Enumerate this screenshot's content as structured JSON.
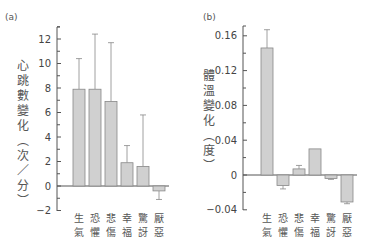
{
  "chart_data": [
    {
      "panel": "(a)",
      "type": "bar",
      "title": "",
      "ylabel": "心跳數變化（次/分）",
      "xlabel": "",
      "categories": [
        "生氣",
        "恐懼",
        "悲傷",
        "幸福",
        "驚訝",
        "厭惡"
      ],
      "values": [
        7.9,
        7.9,
        6.9,
        1.9,
        1.6,
        -0.4
      ],
      "error_ends": [
        10.4,
        12.4,
        11.7,
        3.3,
        5.8,
        -1.1
      ],
      "ylim": [
        -2,
        13
      ],
      "yticks": [
        -2,
        0,
        2,
        4,
        6,
        8,
        10,
        12
      ],
      "ytick_labels": [
        "−2",
        "0",
        "2",
        "4",
        "6",
        "8",
        "10",
        "12"
      ],
      "grid": false,
      "bar_color": "#d0d0d0"
    },
    {
      "panel": "(b)",
      "type": "bar",
      "title": "",
      "ylabel": "體溫變化（度）",
      "xlabel": "",
      "categories": [
        "生氣",
        "恐懼",
        "悲傷",
        "幸福",
        "驚訝",
        "厭惡"
      ],
      "values": [
        0.146,
        -0.012,
        0.007,
        0.03,
        -0.004,
        -0.031
      ],
      "error_ends": [
        0.167,
        -0.016,
        0.011,
        0.03,
        -0.005,
        -0.033
      ],
      "ylim": [
        -0.04,
        0.17
      ],
      "yticks": [
        -0.04,
        0,
        0.04,
        0.08,
        0.12,
        0.16
      ],
      "ytick_labels": [
        "−0.04",
        "0",
        "0.04",
        "0.08",
        "0.12",
        "0.16"
      ],
      "grid": false,
      "bar_color": "#d0d0d0"
    }
  ]
}
